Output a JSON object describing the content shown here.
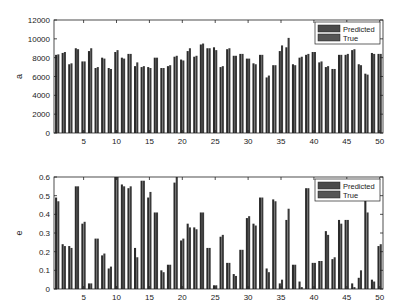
{
  "chart_data": [
    {
      "type": "bar",
      "title": "",
      "xlabel": "",
      "ylabel": "a",
      "ylim": [
        0,
        12000
      ],
      "yticks": [
        0,
        2000,
        4000,
        6000,
        8000,
        10000,
        12000
      ],
      "xticks": [
        5,
        10,
        15,
        20,
        25,
        30,
        35,
        40,
        45,
        50
      ],
      "xlim": [
        0.5,
        50.5
      ],
      "legend": {
        "position": "upper-right",
        "entries": [
          "Predicted",
          "True"
        ]
      },
      "grid": false,
      "categories": [
        1,
        2,
        3,
        4,
        5,
        6,
        7,
        8,
        9,
        10,
        11,
        12,
        13,
        14,
        15,
        16,
        17,
        18,
        19,
        20,
        21,
        22,
        23,
        24,
        25,
        26,
        27,
        28,
        29,
        30,
        31,
        32,
        33,
        34,
        35,
        36,
        37,
        38,
        39,
        40,
        41,
        42,
        43,
        44,
        45,
        46,
        47,
        48,
        49,
        50
      ],
      "series": [
        {
          "name": "Predicted",
          "color": "#2b2b2b",
          "values": [
            8300,
            8500,
            7300,
            9000,
            7600,
            8700,
            6900,
            8000,
            6900,
            8600,
            8000,
            8400,
            7100,
            7000,
            7000,
            8000,
            6900,
            7100,
            8100,
            7800,
            8700,
            8100,
            9400,
            9000,
            9100,
            7000,
            8900,
            8200,
            8400,
            7900,
            7400,
            8300,
            5900,
            7200,
            8700,
            9100,
            7300,
            8000,
            8300,
            8600,
            7500,
            7000,
            6800,
            8300,
            8300,
            8800,
            7300,
            6300,
            8500,
            8400
          ]
        },
        {
          "name": "True",
          "color": "#3a3a3a",
          "values": [
            8350,
            8600,
            7400,
            8900,
            7600,
            9000,
            7000,
            7900,
            6800,
            8800,
            7900,
            8400,
            7500,
            7100,
            6900,
            8000,
            6900,
            7200,
            8200,
            7700,
            9000,
            8200,
            9500,
            9000,
            8800,
            7100,
            9000,
            8200,
            8400,
            7900,
            7300,
            8300,
            6100,
            7200,
            9300,
            10100,
            7200,
            8100,
            8400,
            8600,
            7600,
            7100,
            6800,
            8300,
            8400,
            8900,
            7200,
            6200,
            8400,
            8400
          ]
        }
      ]
    },
    {
      "type": "bar",
      "title": "",
      "xlabel": "",
      "ylabel": "e",
      "ylim": [
        0,
        0.6
      ],
      "yticks": [
        0,
        0.1,
        0.2,
        0.3,
        0.4,
        0.5,
        0.6
      ],
      "xticks": [
        5,
        10,
        15,
        20,
        25,
        30,
        35,
        40,
        45,
        50
      ],
      "xlim": [
        0.5,
        50.5
      ],
      "legend": {
        "position": "upper-right",
        "entries": [
          "Predicted",
          "True"
        ]
      },
      "grid": false,
      "categories": [
        1,
        2,
        3,
        4,
        5,
        6,
        7,
        8,
        9,
        10,
        11,
        12,
        13,
        14,
        15,
        16,
        17,
        18,
        19,
        20,
        21,
        22,
        23,
        24,
        25,
        26,
        27,
        28,
        29,
        30,
        31,
        32,
        33,
        34,
        35,
        36,
        37,
        38,
        39,
        40,
        41,
        42,
        43,
        44,
        45,
        46,
        47,
        48,
        49,
        50
      ],
      "series": [
        {
          "name": "Predicted",
          "color": "#2b2b2b",
          "values": [
            0.49,
            0.24,
            0.23,
            0.55,
            0.35,
            0.03,
            0.27,
            0.18,
            0.11,
            0.6,
            0.56,
            0.54,
            0.22,
            0.58,
            0.49,
            0.41,
            0.1,
            0.13,
            0.57,
            0.26,
            0.35,
            0.33,
            0.41,
            0.22,
            0.02,
            0.28,
            0.14,
            0.08,
            0.21,
            0.38,
            0.35,
            0.49,
            0.11,
            0.48,
            0.03,
            0.37,
            0.13,
            0.04,
            0.54,
            0.14,
            0.15,
            0.31,
            0.16,
            0.37,
            0.37,
            0.03,
            0.06,
            0.48,
            0.05,
            0.23
          ]
        },
        {
          "name": "True",
          "color": "#3a3a3a",
          "values": [
            0.47,
            0.23,
            0.22,
            0.55,
            0.36,
            0.03,
            0.27,
            0.19,
            0.12,
            0.6,
            0.55,
            0.55,
            0.17,
            0.58,
            0.52,
            0.41,
            0.09,
            0.13,
            0.6,
            0.27,
            0.33,
            0.32,
            0.41,
            0.22,
            0.02,
            0.29,
            0.14,
            0.07,
            0.21,
            0.39,
            0.34,
            0.49,
            0.09,
            0.47,
            0.05,
            0.43,
            0.13,
            0.01,
            0.54,
            0.14,
            0.15,
            0.29,
            0.17,
            0.35,
            0.37,
            0.01,
            0.1,
            0.41,
            0.04,
            0.24
          ]
        }
      ]
    }
  ],
  "legend_labels": {
    "predicted": "Predicted",
    "true": "True"
  }
}
